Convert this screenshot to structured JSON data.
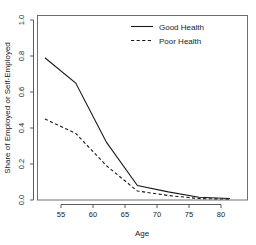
{
  "chart_data": {
    "type": "line",
    "title": "",
    "xlabel": "Age",
    "ylabel": "Share of Employed or Self-Employed",
    "xlim": [
      51.5,
      82.5
    ],
    "ylim": [
      0.0,
      1.0
    ],
    "xticks": [
      55,
      60,
      65,
      70,
      75,
      80
    ],
    "xtick_labels": [
      "55",
      "60",
      "65",
      "70",
      "75",
      "80"
    ],
    "yticks": [
      0.0,
      0.2,
      0.4,
      0.6,
      0.8,
      1.0
    ],
    "ytick_labels": [
      "0.0",
      "0.2",
      "0.4",
      "0.6",
      "0.8",
      "1.0"
    ],
    "grid": false,
    "legend_position": "top-right",
    "x": [
      52,
      57,
      62,
      67,
      72,
      77,
      82
    ],
    "series": [
      {
        "name": "Good Health",
        "linestyle": "solid",
        "color": "#1a1a1a",
        "values": [
          0.79,
          0.65,
          0.32,
          0.08,
          0.045,
          0.015,
          0.008
        ]
      },
      {
        "name": "Poor Health",
        "linestyle": "dashed",
        "color": "#1a1a1a",
        "values": [
          0.45,
          0.37,
          0.19,
          0.05,
          0.025,
          0.008,
          0.005
        ]
      }
    ]
  },
  "legend": {
    "entries": [
      {
        "label": "Good Health",
        "style": "solid"
      },
      {
        "label": "Poor Health",
        "style": "dashed"
      }
    ]
  },
  "axis": {
    "x_title": "Age",
    "y_title": "Share of Employed or Self-Employed"
  }
}
